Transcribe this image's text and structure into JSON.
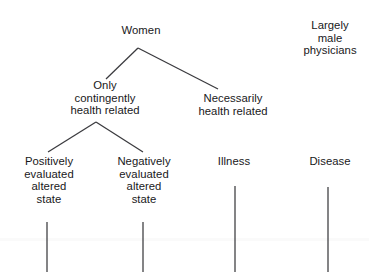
{
  "diagram": {
    "background_color": "#ffffff",
    "line_color": "#3a3a3e",
    "text_color": "#18181a",
    "nodes": [
      {
        "id": "women",
        "label": "Women",
        "x": 141,
        "y": 24
      },
      {
        "id": "largely-male-physicians",
        "label": "Largely\nmale\nphysicians",
        "x": 330,
        "y": 19
      },
      {
        "id": "only-contingently-health-related",
        "label": "Only\ncontingently\nhealth related",
        "x": 105,
        "y": 79
      },
      {
        "id": "necessarily-health-related",
        "label": "Necessarily\nhealth related",
        "x": 233,
        "y": 92
      },
      {
        "id": "positively-evaluated-altered-state",
        "label": "Positively\nevaluated\naltered\nstate",
        "x": 49,
        "y": 155
      },
      {
        "id": "negatively-evaluated-altered-state",
        "label": "Negatively\nevaluated\naltered\nstate",
        "x": 144,
        "y": 155
      },
      {
        "id": "illness",
        "label": "Illness",
        "x": 234,
        "y": 155
      },
      {
        "id": "disease",
        "label": "Disease",
        "x": 330,
        "y": 155
      }
    ],
    "edges": [
      {
        "id": "women-to-only-contingently",
        "from": "women",
        "to": "only-contingently-health-related",
        "x1": 138,
        "y1": 48,
        "x2": 106,
        "y2": 79
      },
      {
        "id": "women-to-necessarily",
        "from": "women",
        "to": "necessarily-health-related",
        "x1": 138,
        "y1": 48,
        "x2": 218,
        "y2": 89
      },
      {
        "id": "contingently-to-positively",
        "from": "only-contingently-health-related",
        "to": "positively-evaluated-altered-state",
        "x1": 96,
        "y1": 122,
        "x2": 48,
        "y2": 152
      },
      {
        "id": "contingently-to-negatively",
        "from": "only-contingently-health-related",
        "to": "negatively-evaluated-altered-state",
        "x1": 96,
        "y1": 122,
        "x2": 143,
        "y2": 152
      },
      {
        "id": "positively-descender",
        "from": "positively-evaluated-altered-state",
        "to": null,
        "x1": 47,
        "y1": 222,
        "x2": 47,
        "y2": 272
      },
      {
        "id": "negatively-descender",
        "from": "negatively-evaluated-altered-state",
        "to": null,
        "x1": 143,
        "y1": 222,
        "x2": 143,
        "y2": 272
      },
      {
        "id": "illness-descender",
        "from": "illness",
        "to": null,
        "x1": 235,
        "y1": 186,
        "x2": 235,
        "y2": 272
      },
      {
        "id": "disease-descender",
        "from": "disease",
        "to": null,
        "x1": 328,
        "y1": 187,
        "x2": 328,
        "y2": 272
      }
    ]
  }
}
